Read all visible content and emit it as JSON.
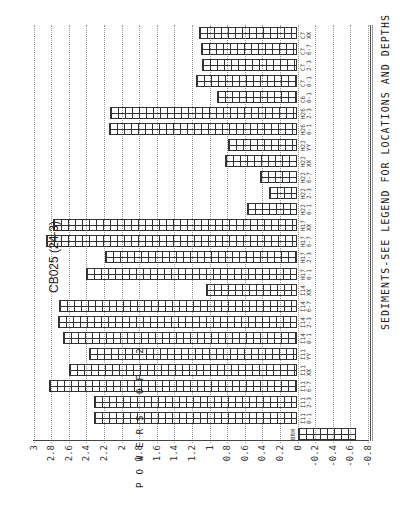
{
  "chart_data": {
    "type": "bar",
    "orientation": "horizontal-rotated",
    "title": "CB025 (24-3)",
    "ylabel": "POWERS OF 2",
    "footer": "SEDIMENTS-SEE LEGEND FOR LOCATIONS AND DEPTHS",
    "ylim": [
      -0.8,
      3
    ],
    "ticks": [
      "3",
      "2.8",
      "2.6",
      "2.4",
      "2.2",
      "2",
      "1.8",
      "1.6",
      "1.4",
      "1.2",
      "1",
      "0.8",
      "0.6",
      "0.4",
      "0.2",
      "0",
      "-0.2",
      "-0.4",
      "-0.6",
      "-0.8"
    ],
    "grid": true,
    "categories": [
      "BRH",
      "I11 0-1",
      "I11 2-3",
      "I11 6-7",
      "I11 XX",
      "I11 YY",
      "I14 0-1",
      "I14 2-3",
      "I14 6-7",
      "I14 XX",
      "H17 0-1",
      "H17 2-3",
      "H17 6-7",
      "H17 XX",
      "H22 0-1",
      "H22 2-3",
      "H22 6-7",
      "H22 XX",
      "H22 YY",
      "H26 0-1",
      "H26 2-3",
      "C6 0-1",
      "C7 0-1",
      "C7 2-3",
      "C7 6-7",
      "C7 XX"
    ],
    "values": [
      -0.66,
      2.31,
      2.31,
      2.82,
      2.6,
      2.37,
      2.66,
      2.72,
      2.71,
      1.04,
      2.4,
      2.19,
      2.86,
      2.78,
      0.57,
      0.32,
      0.43,
      0.82,
      0.79,
      2.14,
      2.13,
      0.91,
      1.15,
      1.08,
      1.1,
      1.12
    ]
  }
}
